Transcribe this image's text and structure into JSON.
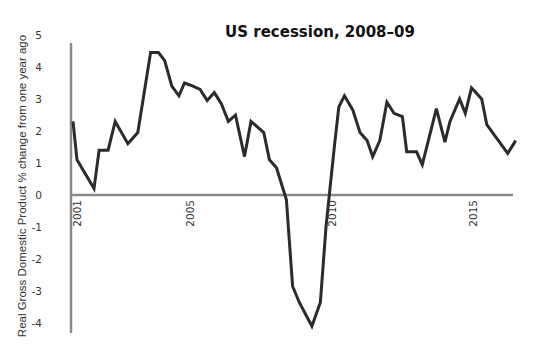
{
  "chart_data": {
    "type": "line",
    "title": "US recession, 2008–09",
    "xlabel": "",
    "ylabel": "Real Gross Domestic Product % change from one year ago",
    "ylim": [
      -4,
      5
    ],
    "yticks": [
      "5",
      "4",
      "3",
      "2",
      "1",
      "0",
      "-1",
      "-2",
      "-3",
      "-4"
    ],
    "xticks": [
      "2001",
      "2005",
      "2010",
      "2015"
    ],
    "grid": false,
    "legend": null,
    "series": [
      {
        "name": "Real GDP % change YoY",
        "color": "#2b2b2b",
        "x": [
          2000.86,
          2001.0,
          2001.6,
          2001.78,
          2002.1,
          2002.35,
          2002.8,
          2003.15,
          2003.6,
          2003.88,
          2004.1,
          2004.35,
          2004.6,
          2004.8,
          2005.1,
          2005.35,
          2005.6,
          2005.85,
          2006.1,
          2006.35,
          2006.6,
          2006.92,
          2007.15,
          2007.6,
          2007.8,
          2008.05,
          2008.4,
          2008.62,
          2008.85,
          2009.3,
          2009.6,
          2009.8,
          2009.95,
          2010.1,
          2010.25,
          2010.45,
          2010.75,
          2011.0,
          2011.25,
          2011.45,
          2011.7,
          2011.95,
          2012.2,
          2012.5,
          2012.65,
          2013.0,
          2013.2,
          2013.7,
          2014.0,
          2014.18,
          2014.52,
          2014.72,
          2014.94,
          2015.3,
          2015.48,
          2016.22,
          2016.5
        ],
        "y": [
          2.3,
          1.1,
          0.2,
          1.4,
          1.4,
          2.3,
          1.6,
          1.95,
          4.45,
          4.45,
          4.2,
          3.4,
          3.1,
          3.5,
          3.4,
          3.3,
          2.95,
          3.2,
          2.85,
          2.3,
          2.5,
          1.2,
          2.3,
          1.95,
          1.1,
          0.85,
          -0.15,
          -2.85,
          -3.35,
          -4.1,
          -3.35,
          -1.0,
          0.3,
          1.55,
          2.75,
          3.1,
          2.65,
          1.95,
          1.7,
          1.2,
          1.7,
          2.9,
          2.55,
          2.45,
          1.35,
          1.35,
          0.95,
          2.7,
          1.65,
          2.3,
          3.0,
          2.55,
          3.35,
          3.0,
          2.2,
          1.3,
          1.7
        ]
      }
    ],
    "annotations": []
  },
  "layout": {
    "axis_color": "#8a8a8a",
    "line_color": "#2b2b2b"
  }
}
